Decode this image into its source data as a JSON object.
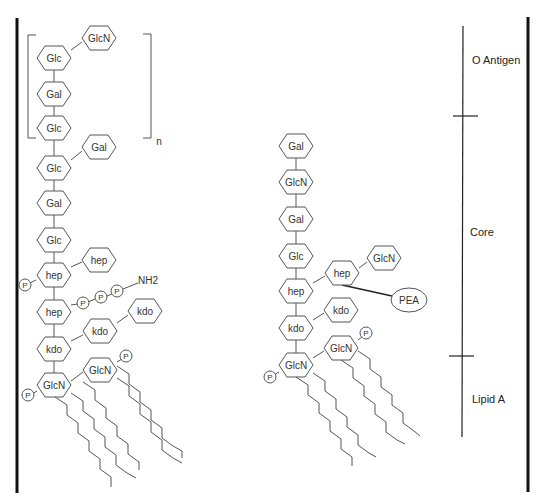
{
  "diagram": {
    "repeat_subscript": "n",
    "amine_label": "NH2",
    "phosphate_label": "P",
    "pea_label": "PEA",
    "regions": [
      {
        "label": "O Antigen"
      },
      {
        "label": "Core"
      },
      {
        "label": "Lipid A"
      }
    ],
    "left_structure": {
      "backbone": [
        "Glc",
        "Gal",
        "Glc",
        "Glc",
        "Gal",
        "Glc",
        "hep",
        "hep",
        "kdo",
        "GlcN"
      ],
      "branches": [
        "GlcN",
        "Gal",
        "hep",
        "kdo",
        "kdo",
        "GlcN"
      ]
    },
    "right_structure": {
      "backbone": [
        "Gal",
        "GlcN",
        "Gal",
        "Glc",
        "hep",
        "kdo",
        "GlcN"
      ],
      "branches": [
        "hep",
        "GlcN",
        "kdo",
        "GlcN"
      ]
    }
  }
}
